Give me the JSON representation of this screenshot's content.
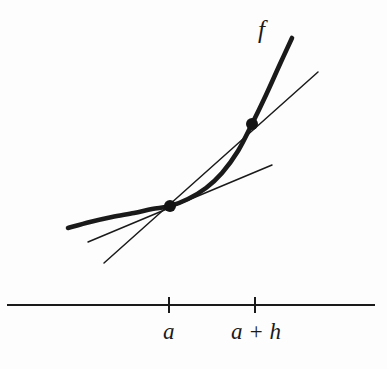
{
  "figure": {
    "background_color": "#fdfdfd",
    "ink_color": "#1a1a1a",
    "width": 387,
    "height": 369
  },
  "labels": {
    "function_label": "f",
    "point_a_label": "a",
    "point_a_plus_h_label": "a + h"
  },
  "chart_data": {
    "type": "line",
    "xlabel": "",
    "ylabel": "",
    "grid": false,
    "legend_position": "none",
    "axis": {
      "x_start_px": 7,
      "x_end_px": 375,
      "y_px": 305,
      "tick_positions_px": [
        169,
        255
      ],
      "tick_labels": [
        "a",
        "a + h"
      ],
      "tick_top_px": 297,
      "tick_bottom_px": 313
    },
    "series": [
      {
        "name": "f",
        "role": "curve",
        "stroke_width": 4.6,
        "points_px": [
          [
            68,
            228
          ],
          [
            90,
            222
          ],
          [
            112,
            217
          ],
          [
            134,
            213
          ],
          [
            152,
            209
          ],
          [
            170,
            206
          ],
          [
            188,
            199
          ],
          [
            206,
            188
          ],
          [
            222,
            173
          ],
          [
            238,
            151
          ],
          [
            252,
            124
          ],
          [
            266,
            95
          ],
          [
            280,
            64
          ],
          [
            292,
            38
          ]
        ]
      },
      {
        "name": "secant",
        "role": "secant-line",
        "stroke_width": 1.5,
        "points_px": [
          [
            104,
            263
          ],
          [
            318,
            72
          ]
        ]
      },
      {
        "name": "tangent",
        "role": "tangent-line",
        "stroke_width": 1.5,
        "points_px": [
          [
            88,
            242
          ],
          [
            272,
            165
          ]
        ]
      }
    ],
    "markers": [
      {
        "name": "point-a",
        "x_px": 170,
        "y_px": 206,
        "radius_px": 6,
        "label": "a"
      },
      {
        "name": "point-a-plus-h",
        "x_px": 252,
        "y_px": 124,
        "radius_px": 6,
        "label": "a + h"
      }
    ]
  }
}
